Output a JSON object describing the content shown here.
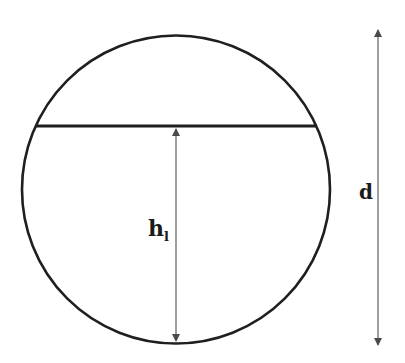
{
  "diagram": {
    "labels": {
      "fill_height_main": "h",
      "fill_height_sub": "l",
      "diameter": "d"
    },
    "colors": {
      "stroke": "#1f1f1f",
      "arrow": "#5a5a5a",
      "background": "#ffffff"
    },
    "geometry": {
      "circle": {
        "cx": 176,
        "cy": 189.5,
        "r": 154
      },
      "liquid_surface_y": 126,
      "fill_height_arrow_x": 176,
      "diameter_arrow_x": 378
    }
  }
}
